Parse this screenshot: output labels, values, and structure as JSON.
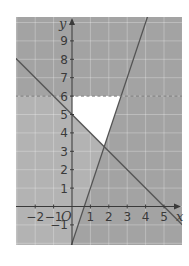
{
  "chart_data": {
    "type": "line",
    "title": "",
    "xlabel": "x",
    "ylabel": "y",
    "origin_label": "O",
    "xlim": [
      -3,
      6
    ],
    "ylim": [
      -2,
      10.3
    ],
    "grid": true,
    "x_ticks": [
      -2,
      -1,
      1,
      2,
      3,
      4,
      5
    ],
    "x_tick_labels": [
      "−2",
      "−1",
      "1",
      "2",
      "3",
      "4",
      "5"
    ],
    "y_ticks": [
      -1,
      1,
      2,
      3,
      4,
      5,
      6,
      7,
      8,
      9
    ],
    "y_tick_labels": [
      "−1",
      "1",
      "2",
      "3",
      "4",
      "5",
      "6",
      "7",
      "8",
      "9"
    ],
    "series": [
      {
        "name": "y = 5 − x",
        "style": "solid",
        "points": [
          [
            -3,
            8
          ],
          [
            0,
            5
          ],
          [
            5,
            0
          ],
          [
            6,
            -1
          ]
        ]
      },
      {
        "name": "y = 3x − 2",
        "style": "solid",
        "points": [
          [
            0,
            -2
          ],
          [
            0.67,
            0
          ],
          [
            2.67,
            6
          ],
          [
            4.1,
            10.3
          ]
        ]
      },
      {
        "name": "y = 6",
        "style": "dashed",
        "points": [
          [
            -3,
            6
          ],
          [
            6,
            6
          ]
        ]
      }
    ],
    "unshaded_region": {
      "description": "Feasible region left unshaded (white)",
      "vertices": [
        [
          0,
          5
        ],
        [
          0,
          6
        ],
        [
          2.67,
          6
        ],
        [
          1.75,
          3.25
        ]
      ]
    },
    "intersection": [
      1.75,
      3.25
    ]
  },
  "colors": {
    "shade_dark": "#a3a3a3",
    "shade_light": "#b3b3b3",
    "feasible": "#ffffff",
    "line": "#555555",
    "grid": "#c8c8c8",
    "axis": "#3a3a3a"
  }
}
